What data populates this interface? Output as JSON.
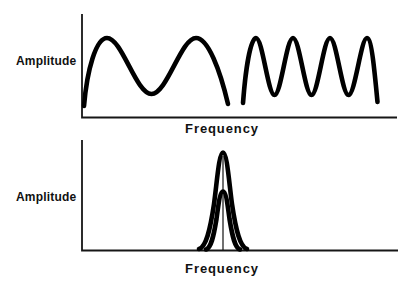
{
  "figure": {
    "background_color": "#ffffff",
    "ink_color": "#000000",
    "axis_color": "#161616"
  },
  "top_chart": {
    "y_axis_label": "Amplitude",
    "x_axis_label": "Frequency",
    "axes_path": "M 82 14 L 82 117.5 L 397 117.5",
    "curves": {
      "low_frequency_wave": "M 84 106 C 87 70, 96 38, 107 38 C 122 38, 136 94, 151.5 94 C 167 94, 181 38, 196 38 C 208 38, 220 70, 228 104",
      "high_frequency_wave": "M 243 103 C 245.5 70, 250.5 38, 256 38 C 262.5 38, 268 95, 274.5 95 C 281 95, 286.5 38, 293 38 C 299.5 38, 305 95, 311.5 95 C 318 95, 323.5 38, 330 38 C 336.5 38, 342 95, 348.5 95 C 355 95, 361 38, 367 38 C 371.5 38, 374.5 70, 377.5 102"
    }
  },
  "bottom_chart": {
    "y_axis_label": "Amplitude",
    "x_axis_label": "Frequency",
    "axes_path": "M 82 140 L 82 250.5 L 398 250.5",
    "curves": {
      "tall_narrow_peak": "M 199 249 C 206 247, 210 231, 214 204 C 217 182, 219 152.5, 223 152.5 C 227 152.5, 229 182, 232 204 C 236 231, 240 247, 247 249",
      "short_narrow_peak": "M 206 249.5 C 211 248, 213.5 237, 216.5 219 C 218.5 204, 220 191.5, 223 191.5 C 226 191.5, 227.5 204, 229.5 219 C 232.5 237, 235 248, 240 249.5",
      "center_frequency_line": "M 223 250 L 223 156"
    }
  }
}
